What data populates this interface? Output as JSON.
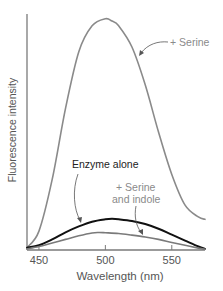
{
  "chart_data": {
    "type": "line",
    "title": "",
    "xlabel": "Wavelength (nm)",
    "ylabel": "Fluorescence intensity",
    "xlim": [
      441,
      575
    ],
    "ylim": [
      0,
      100
    ],
    "xticks": [
      450,
      500,
      550
    ],
    "xtick_labels": [
      "450",
      "500",
      "550"
    ],
    "yticks": [],
    "grid": false,
    "legend": "none (direct annotations)",
    "series": [
      {
        "name": "+ Serine",
        "color": "#8a8a8a",
        "x": [
          441,
          450,
          460,
          470,
          480,
          490,
          500,
          505,
          510,
          520,
          530,
          540,
          550,
          560,
          570,
          575
        ],
        "y": [
          1,
          8,
          30,
          60,
          84,
          95,
          98,
          97,
          95,
          86,
          70,
          50,
          32,
          19,
          14,
          13
        ]
      },
      {
        "name": "Enzyme alone",
        "color": "#111111",
        "x": [
          441,
          450,
          460,
          470,
          480,
          490,
          500,
          505,
          510,
          520,
          530,
          540,
          550,
          560,
          570,
          575
        ],
        "y": [
          1,
          2,
          4.5,
          7.5,
          10,
          12,
          13,
          13.2,
          13,
          12.3,
          11,
          9,
          6.5,
          4,
          1.5,
          0.5
        ]
      },
      {
        "name": "+ Serine and indole",
        "color": "#7a7a7a",
        "x": [
          441,
          450,
          460,
          470,
          480,
          490,
          495,
          500,
          510,
          520,
          530,
          540,
          550,
          560,
          570,
          575
        ],
        "y": [
          0.5,
          1.5,
          3,
          4.5,
          6,
          7.2,
          7.4,
          7.3,
          7,
          6.3,
          5.5,
          4.5,
          3.2,
          2,
          0.8,
          0.3
        ]
      }
    ],
    "annotations": [
      {
        "text": "+ Serine",
        "target_series": "+ Serine"
      },
      {
        "text": "Enzyme alone",
        "target_series": "Enzyme alone"
      },
      {
        "text_lines": [
          "+ Serine",
          "and indole"
        ],
        "target_series": "+ Serine and indole"
      }
    ]
  }
}
